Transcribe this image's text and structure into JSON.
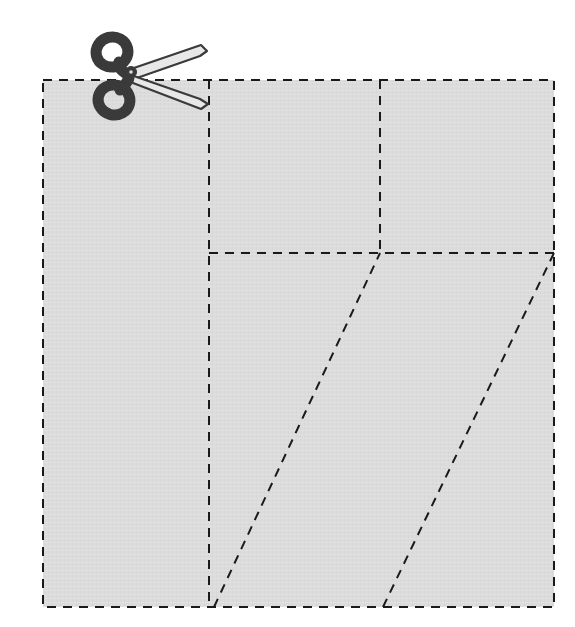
{
  "figure": {
    "title": "Dashed square divided by cut lines with scissors",
    "canvas": {
      "width": 575,
      "height": 627
    },
    "background_color": "#ffffff"
  },
  "shape": {
    "name": "square-sheet",
    "fill_color": "#dcdcdc",
    "stroke_color": "#1a1a1a",
    "stroke_style": "dashed",
    "stroke_width": 2,
    "dash_pattern": "9 7",
    "corners": {
      "top_left": {
        "x": 43,
        "y": 80
      },
      "top_right": {
        "x": 554,
        "y": 80
      },
      "bottom_right": {
        "x": 554,
        "y": 607
      },
      "bottom_left": {
        "x": 43,
        "y": 607
      }
    },
    "width": 511,
    "height": 527
  },
  "cut_lines": [
    {
      "name": "vertical-cut-left",
      "type": "vertical",
      "x1": 209,
      "y1": 80,
      "x2": 209,
      "y2": 607
    },
    {
      "name": "vertical-cut-middle",
      "type": "vertical",
      "x1": 380,
      "y1": 80,
      "x2": 380,
      "y2": 253
    },
    {
      "name": "horizontal-cut",
      "type": "horizontal",
      "x1": 209,
      "y1": 253,
      "x2": 554,
      "y2": 253
    },
    {
      "name": "diagonal-cut-left",
      "type": "diagonal",
      "x1": 214,
      "y1": 607,
      "x2": 380,
      "y2": 253
    },
    {
      "name": "diagonal-cut-right",
      "type": "diagonal",
      "x1": 383,
      "y1": 607,
      "x2": 554,
      "y2": 253
    }
  ],
  "scissors": {
    "name": "scissors-icon",
    "label": "scissors",
    "body_color": "#3a3a3a",
    "blade_fill": "#e8e8e8",
    "blade_outline": "#3a3a3a",
    "pivot": {
      "x": 131,
      "y": 72
    },
    "upper_ring": {
      "cx": 112,
      "cy": 52,
      "rx": 16,
      "ry": 15
    },
    "lower_ring": {
      "cx": 114,
      "cy": 100,
      "rx": 16,
      "ry": 15
    },
    "upper_blade_tip": {
      "x": 205,
      "y": 50
    },
    "lower_blade_tip": {
      "x": 206,
      "y": 104
    }
  },
  "chart_data": {
    "type": "diagram",
    "title": "Dashed square divided by cut lines with scissors",
    "shape": "square",
    "regions": 6,
    "annotations": []
  }
}
